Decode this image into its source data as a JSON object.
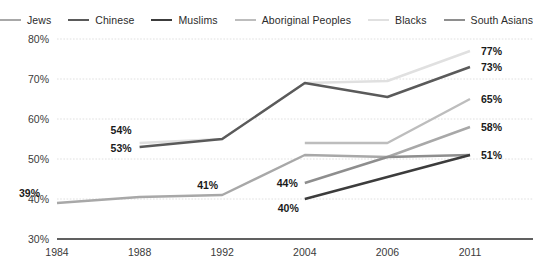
{
  "chart_data": {
    "type": "line",
    "title": "",
    "xlabel": "",
    "ylabel": "",
    "categories": [
      "1984",
      "1988",
      "1992",
      "2004",
      "2006",
      "2011"
    ],
    "ylim": [
      30,
      80
    ],
    "y_ticks": [
      30,
      40,
      50,
      60,
      70,
      80
    ],
    "y_tick_labels": [
      "30%",
      "40%",
      "50%",
      "60%",
      "70%",
      "80%"
    ],
    "grid": true,
    "legend_position": "top",
    "series": [
      {
        "name": "Jews",
        "color": "#a8a8a8",
        "x": [
          "1984",
          "1988",
          "1992",
          "2004",
          "2006",
          "2011"
        ],
        "values": [
          39,
          40.5,
          41,
          51,
          50.5,
          58
        ]
      },
      {
        "name": "Chinese",
        "color": "#5a5a5a",
        "x": [
          "1988",
          "1992",
          "2004",
          "2006",
          "2011"
        ],
        "values": [
          53,
          55,
          69,
          65.5,
          73
        ]
      },
      {
        "name": "Muslims",
        "color": "#3c3c3c",
        "x": [
          "2004",
          "2006",
          "2011"
        ],
        "values": [
          40,
          45.5,
          51
        ]
      },
      {
        "name": "Aboriginal Peoples",
        "color": "#bdbdbd",
        "x": [
          "2004",
          "2006",
          "2011"
        ],
        "values": [
          54,
          54,
          65
        ]
      },
      {
        "name": "Blacks",
        "color": "#e0e0e0",
        "x": [
          "1988",
          "1992",
          "2004",
          "2006",
          "2011"
        ],
        "values": [
          54,
          55,
          69,
          69.5,
          77
        ]
      },
      {
        "name": "South Asians",
        "color": "#8e8e8e",
        "x": [
          "2004",
          "2006",
          "2011"
        ],
        "values": [
          44,
          50.5,
          51
        ]
      }
    ],
    "annotations": [
      {
        "text": "39%",
        "series": "Jews",
        "category": "1984",
        "value": 39
      },
      {
        "text": "54%",
        "series": "Blacks",
        "category": "1988",
        "value": 54
      },
      {
        "text": "53%",
        "series": "Chinese",
        "category": "1988",
        "value": 53
      },
      {
        "text": "41%",
        "series": "Jews",
        "category": "1992",
        "value": 41
      },
      {
        "text": "44%",
        "series": "South Asians",
        "category": "2004",
        "value": 44
      },
      {
        "text": "40%",
        "series": "Muslims",
        "category": "2004",
        "value": 40
      },
      {
        "text": "77%",
        "series": "Blacks",
        "category": "2011",
        "value": 77
      },
      {
        "text": "73%",
        "series": "Chinese",
        "category": "2011",
        "value": 73
      },
      {
        "text": "65%",
        "series": "Aboriginal Peoples",
        "category": "2011",
        "value": 65
      },
      {
        "text": "58%",
        "series": "Jews",
        "category": "2011",
        "value": 58
      },
      {
        "text": "51%",
        "series": "Muslims",
        "category": "2011",
        "value": 51
      }
    ]
  },
  "legend": {
    "items": [
      {
        "label": "Jews",
        "color": "#a8a8a8"
      },
      {
        "label": "Chinese",
        "color": "#5a5a5a"
      },
      {
        "label": "Muslims",
        "color": "#3c3c3c"
      },
      {
        "label": "Aboriginal Peoples",
        "color": "#bdbdbd"
      },
      {
        "label": "Blacks",
        "color": "#e0e0e0"
      },
      {
        "label": "South Asians",
        "color": "#8e8e8e"
      }
    ]
  }
}
